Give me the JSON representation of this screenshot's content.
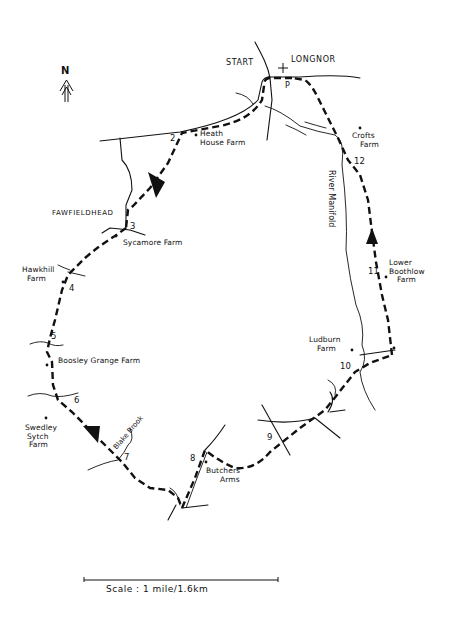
{
  "map": {
    "title": "Longnor circular walk map",
    "north_label": "N",
    "start_label": "START",
    "village_label": "LONGNOR",
    "parking_label": "P",
    "hamlet_label": "FAWFIELDHEAD",
    "river_label": "River Manifold",
    "brook_label": "Blake Brook",
    "scale_label": "Scale : 1 mile/1.6km",
    "route_color": "#111111",
    "landmarks": [
      {
        "name": "Heath House Farm",
        "lines": [
          "Heath",
          "House Farm"
        ]
      },
      {
        "name": "Crofts Farm",
        "lines": [
          "Crofts",
          "Farm"
        ]
      },
      {
        "name": "Sycamore Farm",
        "lines": [
          "Sycamore Farm"
        ]
      },
      {
        "name": "Hawkhill Farm",
        "lines": [
          "Hawkhill",
          "Farm"
        ]
      },
      {
        "name": "Lower Boothlow Farm",
        "lines": [
          "Lower",
          "Boothlow",
          "Farm"
        ]
      },
      {
        "name": "Boosley Grange Farm",
        "lines": [
          "Boosley Grange Farm"
        ]
      },
      {
        "name": "Ludburn Farm",
        "lines": [
          "Ludburn",
          "Farm"
        ]
      },
      {
        "name": "Swedley Sytch Farm",
        "lines": [
          "Swedley",
          "Sytch",
          "Farm"
        ]
      },
      {
        "name": "Butchers Arms",
        "lines": [
          "Butchers",
          "Arms"
        ]
      }
    ],
    "waypoints": [
      "2",
      "3",
      "4",
      "5",
      "6",
      "7",
      "8",
      "9",
      "10",
      "11",
      "12"
    ]
  }
}
